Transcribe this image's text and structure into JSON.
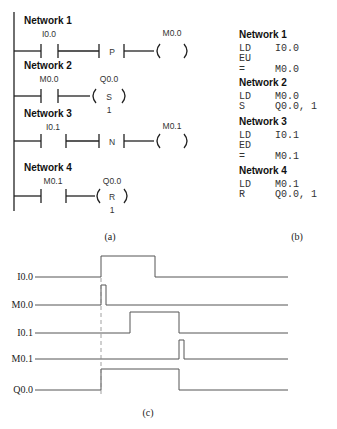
{
  "ladder": {
    "networks": [
      {
        "title": "Network 1",
        "contact": "I0.0",
        "edge": "P",
        "coil": "M0.0",
        "coil_type": "",
        "coil_n": ""
      },
      {
        "title": "Network 2",
        "contact": "M0.0",
        "coil": "Q0.0",
        "coil_type": "S",
        "coil_n": "1"
      },
      {
        "title": "Network 3",
        "contact": "I0.1",
        "edge": "N",
        "coil": "M0.1",
        "coil_type": "",
        "coil_n": ""
      },
      {
        "title": "Network 4",
        "contact": "M0.1",
        "coil": "Q0.0",
        "coil_type": "R",
        "coil_n": "1"
      }
    ],
    "caption": "(a)"
  },
  "stl": {
    "networks": [
      {
        "title": "Network 1",
        "lines": [
          [
            "LD",
            "I0.0"
          ],
          [
            "EU",
            ""
          ],
          [
            "=",
            "M0.0"
          ]
        ]
      },
      {
        "title": "Network 2",
        "lines": [
          [
            "LD",
            "M0.0"
          ],
          [
            "S",
            "Q0.0, 1"
          ]
        ]
      },
      {
        "title": "Network 3",
        "lines": [
          [
            "LD",
            "I0.1"
          ],
          [
            "ED",
            ""
          ],
          [
            "=",
            "M0.1"
          ]
        ]
      },
      {
        "title": "Network 4",
        "lines": [
          [
            "LD",
            "M0.1"
          ],
          [
            "R",
            "Q0.0, 1"
          ]
        ]
      }
    ],
    "caption": "(b)"
  },
  "timing": {
    "signals": [
      "I0.0",
      "M0.0",
      "I0.1",
      "M0.1",
      "Q0.0"
    ],
    "caption": "(c)"
  }
}
